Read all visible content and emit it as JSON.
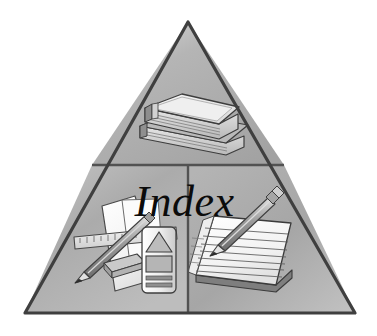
{
  "graphic": {
    "title": "Index",
    "type": "pyramid-icon",
    "background_color": "#ffffff",
    "outline_color": "#454545",
    "fill_color": "#a6a6a6",
    "fill_light": "#d9d9d9",
    "fill_dark": "#8a8a8a",
    "panel_divider_color": "#555555",
    "label_color": "#0b0b0b",
    "apex": {
      "x": 188,
      "y": 22
    },
    "bottom_left": {
      "x": 25,
      "y": 313
    },
    "bottom_right": {
      "x": 355,
      "y": 313
    },
    "horizontal_divider_y": 165,
    "vertical_divider_x": 188,
    "sections": [
      {
        "name": "top",
        "contents_label": "stacked-books",
        "item_count": 2
      },
      {
        "name": "bottom-left",
        "contents_label": "ruler-pencil-eraser-paper-crayon",
        "item_count": 5
      },
      {
        "name": "bottom-right",
        "contents_label": "lined-notepad-with-pencil",
        "item_count": 2
      }
    ]
  },
  "label": {
    "text": "Index"
  },
  "icons": {
    "book_top": "book-icon",
    "book_bottom": "book-icon",
    "ruler": "ruler-icon",
    "pencil_left": "pencil-icon",
    "eraser": "eraser-icon",
    "paper": "paper-sheet-icon",
    "crayon": "crayon-icon",
    "notepad": "notepad-icon",
    "pencil_right": "pencil-icon"
  }
}
